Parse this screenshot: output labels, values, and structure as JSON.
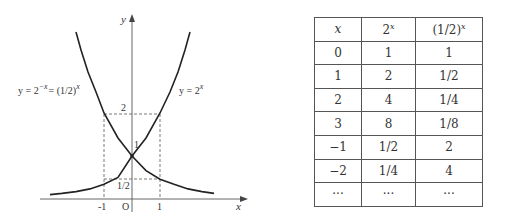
{
  "graph": {
    "axis_x_label": "x",
    "axis_y_label": "y",
    "origin_label": "O",
    "x_ticks": [
      "-1",
      "1"
    ],
    "y_ticks": [
      "2",
      "1",
      "1/2"
    ],
    "curve_left_label": {
      "prefix": "y = 2",
      "exp1": "−x",
      "mid": "= (1/2)",
      "exp2": "x"
    },
    "curve_right_label": {
      "prefix": "y = 2",
      "exp": "x"
    }
  },
  "table": {
    "headers": [
      {
        "base": "x",
        "sup": ""
      },
      {
        "base": "2",
        "sup": "x"
      },
      {
        "base": "(1/2)",
        "sup": "x"
      }
    ],
    "rows": [
      [
        "0",
        "1",
        "1"
      ],
      [
        "1",
        "2",
        "1/2"
      ],
      [
        "2",
        "4",
        "1/4"
      ],
      [
        "3",
        "8",
        "1/8"
      ],
      [
        "−1",
        "1/2",
        "2"
      ],
      [
        "−2",
        "1/4",
        "4"
      ],
      [
        "···",
        "···",
        "···"
      ]
    ]
  }
}
